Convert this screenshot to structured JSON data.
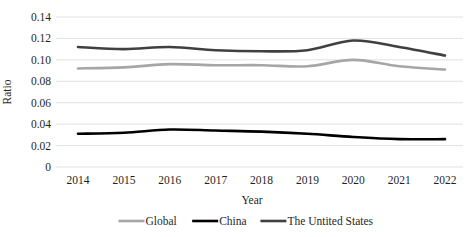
{
  "chart_data": {
    "type": "line",
    "title": "",
    "xlabel": "Year",
    "ylabel": "Ratio",
    "categories": [
      "2014",
      "2015",
      "2016",
      "2017",
      "2018",
      "2019",
      "2020",
      "2021",
      "2022"
    ],
    "x": [
      2014,
      2015,
      2016,
      2017,
      2018,
      2019,
      2020,
      2021,
      2022
    ],
    "ylim": [
      0,
      0.14
    ],
    "yticks": [
      "0",
      "0.02",
      "0.04",
      "0.06",
      "0.08",
      "0.10",
      "0.12",
      "0.14"
    ],
    "ytick_values": [
      0,
      0.02,
      0.04,
      0.06,
      0.08,
      0.1,
      0.12,
      0.14
    ],
    "grid": "horizontal",
    "legend_position": "bottom",
    "smoothing": "spline",
    "series": [
      {
        "name": "Global",
        "color": "#A6A6A6",
        "width": 2.6,
        "values": [
          0.092,
          0.093,
          0.096,
          0.095,
          0.095,
          0.094,
          0.1,
          0.094,
          0.091
        ]
      },
      {
        "name": "China",
        "color": "#000000",
        "width": 2.6,
        "values": [
          0.031,
          0.032,
          0.035,
          0.034,
          0.033,
          0.031,
          0.028,
          0.026,
          0.026
        ]
      },
      {
        "name": "The Untited States",
        "color": "#404040",
        "width": 2.6,
        "values": [
          0.112,
          0.11,
          0.112,
          0.109,
          0.108,
          0.109,
          0.118,
          0.112,
          0.104
        ]
      }
    ]
  },
  "axes": {
    "y_title": "Ratio",
    "x_title": "Year",
    "gridline_color": "#D9D9D9"
  },
  "legend": {
    "entries": [
      {
        "label": "Global",
        "color": "#A6A6A6"
      },
      {
        "label": "China",
        "color": "#000000"
      },
      {
        "label": "The Untited States",
        "color": "#404040"
      }
    ]
  }
}
